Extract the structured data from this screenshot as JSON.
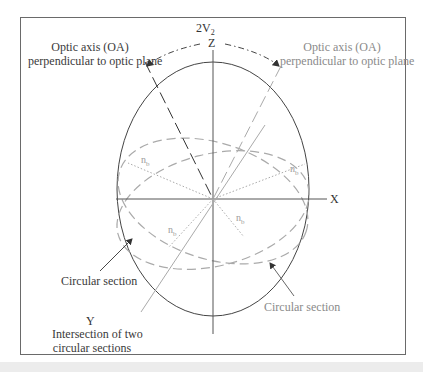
{
  "figure": {
    "arc_label": "2V",
    "arc_label_sub": "2",
    "axes": {
      "z": "Z",
      "x": "X",
      "y": "Y"
    },
    "labels": {
      "optic_axis_left_line1": "Optic axis (OA)",
      "optic_axis_left_line2": "perpendicular to optic plane",
      "optic_axis_right_line1": "Optic axis (OA)",
      "optic_axis_right_line2": "perpendicular to optic plane",
      "circular_section_left": "Circular section",
      "circular_section_right": "Circular section",
      "intersection_line1": "Intersection of two",
      "intersection_line2": "circular sections"
    },
    "nb_label": "n",
    "nb_sub": "b",
    "colors": {
      "dark": "#3a3a3a",
      "grey": "#9a9a9a",
      "frame": "#6a6a6a"
    }
  }
}
